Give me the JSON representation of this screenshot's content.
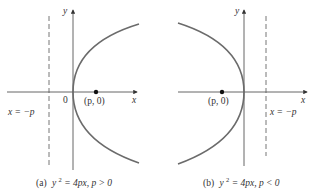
{
  "figure": {
    "panels": [
      {
        "id": "a",
        "caption_prefix": "(a)",
        "caption_eq_lhs": "y",
        "caption_eq_exp": "2",
        "caption_eq_rhs": " = 4px, p > 0",
        "axis_label_x": "x",
        "axis_label_y": "y",
        "origin_label": "0",
        "focus_label": "(p, 0)",
        "directrix_label": "x = −p",
        "opens": "right"
      },
      {
        "id": "b",
        "caption_prefix": "(b)",
        "caption_eq_lhs": "y",
        "caption_eq_exp": "2",
        "caption_eq_rhs": " = 4px, p < 0",
        "axis_label_x": "x",
        "axis_label_y": "y",
        "focus_label": "(p, 0)",
        "directrix_label": "x = −p",
        "opens": "left"
      }
    ],
    "colors": {
      "curve": "#6b6b6b",
      "axis": "#555555",
      "directrix": "#777777",
      "focus": "#111111",
      "text": "#333333"
    }
  }
}
